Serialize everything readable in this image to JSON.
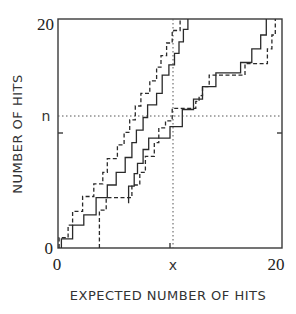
{
  "chart_data": {
    "type": "line",
    "subtype": "step",
    "title": "",
    "xlabel": "EXPECTED NUMBER OF HITS",
    "ylabel": "NUMBER OF HITS",
    "xlim": [
      0,
      20
    ],
    "ylim": [
      0,
      20
    ],
    "x_tick_labels": [
      {
        "value": 0,
        "label": "0"
      },
      {
        "value": 10.3,
        "label": "x"
      },
      {
        "value": 20,
        "label": "20"
      }
    ],
    "y_tick_labels": [
      {
        "value": 0,
        "label": "0"
      },
      {
        "value": 11.5,
        "label": "n"
      },
      {
        "value": 20,
        "label": "20"
      }
    ],
    "minor_ticks": {
      "x": [
        10
      ],
      "y": [
        10
      ]
    },
    "reference_lines": [
      {
        "orientation": "horizontal",
        "value": 11.5,
        "style": "dotted",
        "label": "n"
      },
      {
        "orientation": "vertical",
        "value": 10.3,
        "style": "dotted",
        "label": "x"
      }
    ],
    "grid": false,
    "legend": null,
    "series": [
      {
        "name": "left-solid",
        "style": "solid",
        "points": [
          [
            0.3,
            0
          ],
          [
            0.3,
            0.8
          ],
          [
            1.3,
            0.8
          ],
          [
            1.3,
            2.0
          ],
          [
            2.3,
            2.0
          ],
          [
            2.3,
            2.9
          ],
          [
            3.4,
            2.9
          ],
          [
            3.4,
            4.4
          ],
          [
            4.4,
            4.4
          ],
          [
            4.4,
            5.5
          ],
          [
            5.2,
            5.5
          ],
          [
            5.2,
            6.6
          ],
          [
            6.0,
            6.6
          ],
          [
            6.0,
            7.9
          ],
          [
            6.6,
            7.9
          ],
          [
            6.6,
            9.2
          ],
          [
            7.0,
            9.2
          ],
          [
            7.0,
            10.3
          ],
          [
            7.6,
            10.3
          ],
          [
            7.6,
            11.4
          ],
          [
            8.0,
            11.4
          ],
          [
            8.0,
            12.5
          ],
          [
            8.8,
            12.5
          ],
          [
            8.8,
            13.5
          ],
          [
            9.3,
            13.5
          ],
          [
            9.3,
            15.1
          ],
          [
            9.9,
            15.1
          ],
          [
            9.9,
            16.0
          ],
          [
            10.4,
            16.0
          ],
          [
            10.4,
            17.0
          ],
          [
            10.8,
            17.0
          ],
          [
            10.8,
            18.0
          ],
          [
            11.2,
            18.0
          ],
          [
            11.2,
            19.1
          ],
          [
            11.6,
            19.1
          ],
          [
            11.6,
            20.0
          ]
        ]
      },
      {
        "name": "left-dashed",
        "style": "dashed",
        "points": [
          [
            0.1,
            0
          ],
          [
            0.1,
            0.9
          ],
          [
            0.9,
            0.9
          ],
          [
            0.9,
            2.0
          ],
          [
            1.3,
            2.0
          ],
          [
            1.3,
            3.2
          ],
          [
            2.2,
            3.2
          ],
          [
            2.2,
            4.5
          ],
          [
            3.2,
            4.5
          ],
          [
            3.2,
            5.6
          ],
          [
            4.0,
            5.6
          ],
          [
            4.0,
            6.6
          ],
          [
            4.4,
            6.6
          ],
          [
            4.4,
            7.8
          ],
          [
            5.3,
            7.8
          ],
          [
            5.3,
            9.0
          ],
          [
            5.9,
            9.0
          ],
          [
            5.9,
            10.1
          ],
          [
            6.4,
            10.1
          ],
          [
            6.4,
            11.2
          ],
          [
            6.9,
            11.2
          ],
          [
            6.9,
            12.4
          ],
          [
            7.4,
            12.4
          ],
          [
            7.4,
            13.5
          ],
          [
            8.2,
            13.5
          ],
          [
            8.2,
            14.6
          ],
          [
            8.8,
            14.6
          ],
          [
            8.8,
            15.8
          ],
          [
            9.2,
            15.8
          ],
          [
            9.2,
            16.8
          ],
          [
            9.7,
            16.8
          ],
          [
            9.7,
            17.9
          ],
          [
            10.2,
            17.9
          ],
          [
            10.2,
            19.0
          ],
          [
            10.9,
            19.0
          ],
          [
            10.9,
            20.0
          ]
        ]
      },
      {
        "name": "right-solid",
        "style": "solid",
        "points": [
          [
            6.3,
            3.9
          ],
          [
            6.3,
            5.4
          ],
          [
            6.8,
            5.4
          ],
          [
            6.8,
            6.5
          ],
          [
            7.1,
            6.5
          ],
          [
            7.1,
            7.4
          ],
          [
            7.6,
            7.4
          ],
          [
            7.6,
            8.6
          ],
          [
            8.1,
            8.6
          ],
          [
            8.1,
            9.6
          ],
          [
            10.0,
            9.6
          ],
          [
            10.0,
            10.6
          ],
          [
            11.1,
            10.6
          ],
          [
            11.1,
            12.1
          ],
          [
            12.1,
            12.1
          ],
          [
            12.1,
            13.0
          ],
          [
            12.9,
            13.0
          ],
          [
            12.9,
            14.1
          ],
          [
            14.1,
            14.1
          ],
          [
            14.1,
            15.3
          ],
          [
            16.3,
            15.3
          ],
          [
            16.3,
            16.2
          ],
          [
            17.3,
            16.2
          ],
          [
            17.3,
            17.4
          ],
          [
            18.1,
            17.4
          ],
          [
            18.1,
            18.6
          ],
          [
            18.6,
            18.6
          ],
          [
            18.6,
            20.0
          ]
        ]
      },
      {
        "name": "right-dashed",
        "style": "dashed",
        "points": [
          [
            3.7,
            0
          ],
          [
            3.7,
            3.3
          ],
          [
            4.3,
            3.3
          ],
          [
            4.3,
            4.4
          ],
          [
            6.6,
            4.4
          ],
          [
            6.6,
            5.5
          ],
          [
            7.3,
            5.5
          ],
          [
            7.3,
            6.6
          ],
          [
            7.8,
            6.6
          ],
          [
            7.8,
            8.0
          ],
          [
            8.6,
            8.0
          ],
          [
            8.6,
            9.2
          ],
          [
            9.0,
            9.2
          ],
          [
            9.0,
            10.5
          ],
          [
            9.6,
            10.5
          ],
          [
            9.6,
            11.1
          ],
          [
            10.2,
            11.1
          ],
          [
            10.2,
            12.2
          ],
          [
            12.3,
            12.2
          ],
          [
            12.3,
            12.8
          ],
          [
            12.6,
            12.8
          ],
          [
            12.6,
            13.3
          ],
          [
            12.9,
            13.3
          ],
          [
            12.9,
            14.1
          ],
          [
            13.5,
            14.1
          ],
          [
            13.5,
            15.1
          ],
          [
            16.7,
            15.1
          ],
          [
            16.7,
            16.1
          ],
          [
            18.7,
            16.1
          ],
          [
            18.7,
            17.4
          ],
          [
            19.1,
            17.4
          ],
          [
            19.1,
            18.6
          ],
          [
            19.4,
            18.6
          ],
          [
            19.4,
            20.0
          ]
        ]
      }
    ]
  },
  "labels": {
    "y_top": "20",
    "y_n": "n",
    "y_zero": "0",
    "x_zero": "0",
    "x_x": "x",
    "x_right": "20",
    "xlabel": "EXPECTED NUMBER OF HITS",
    "ylabel": "NUMBER OF HITS"
  },
  "colors": {
    "frame": "#3a3a3a",
    "line": "#2a2a2a",
    "reference": "#555555",
    "background": "#ffffff"
  }
}
